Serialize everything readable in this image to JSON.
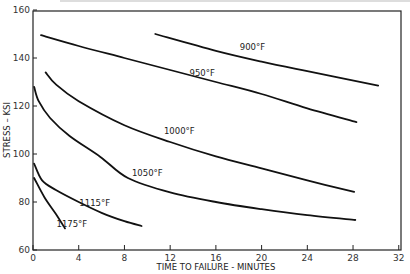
{
  "chart_data": {
    "type": "line",
    "title": "",
    "xlabel": "TIME TO FAILURE -  MINUTES",
    "ylabel": "STRESS – KSI",
    "xlim": [
      0,
      32
    ],
    "ylim": [
      60,
      160
    ],
    "xticks": [
      0,
      4,
      8,
      12,
      16,
      20,
      24,
      28,
      32
    ],
    "yticks": [
      60,
      80,
      100,
      120,
      140,
      160
    ],
    "grid": false,
    "legend": "inline labels",
    "series": [
      {
        "name": "900°F",
        "x": [
          10.7,
          16,
          20,
          24,
          30.2
        ],
        "y": [
          150,
          143,
          138.5,
          134.5,
          128.5
        ]
      },
      {
        "name": "950°F",
        "x": [
          0.7,
          4,
          8,
          12,
          16,
          20,
          24,
          28.3
        ],
        "y": [
          149.5,
          145,
          140,
          135,
          130,
          125,
          119,
          113.3
        ]
      },
      {
        "name": "1000°F",
        "x": [
          1.1,
          2,
          4,
          8,
          12,
          16,
          20,
          24,
          28.1
        ],
        "y": [
          134,
          129,
          122,
          112,
          105,
          99,
          94,
          89,
          84.2
        ]
      },
      {
        "name": "1050°F",
        "x": [
          0.1,
          0.5,
          1.5,
          3.2,
          5.9,
          8.3,
          12,
          16,
          20,
          24,
          28.2
        ],
        "y": [
          128,
          122,
          115,
          107.5,
          98.8,
          90,
          84,
          80,
          77,
          74.5,
          72.5
        ]
      },
      {
        "name": "1115°F",
        "x": [
          0.1,
          0.8,
          2,
          4,
          6,
          8,
          9.5
        ],
        "y": [
          96,
          89,
          85,
          80,
          75.5,
          72,
          70
        ]
      },
      {
        "name": "1175°F",
        "x": [
          0.1,
          1,
          2,
          2.8
        ],
        "y": [
          90,
          82,
          75,
          69
        ]
      }
    ],
    "annotations": [
      {
        "text": "900°F",
        "x": 19.2,
        "y": 143.5
      },
      {
        "text": "950°F",
        "x": 14.8,
        "y": 132.5
      },
      {
        "text": "1000°F",
        "x": 12.8,
        "y": 108.5
      },
      {
        "text": "1050°F",
        "x": 10,
        "y": 91
      },
      {
        "text": "1115°F",
        "x": 5.4,
        "y": 78.5
      },
      {
        "text": "1175°F",
        "x": 3.4,
        "y": 69.5
      }
    ]
  },
  "labels": {
    "x_axis_title": "TIME TO FAILURE -  MINUTES",
    "y_axis_title": "STRESS – KSI",
    "x_ticks": [
      "0",
      "4",
      "8",
      "12",
      "16",
      "20",
      "24",
      "28",
      "32"
    ],
    "y_ticks": [
      "60",
      "80",
      "100",
      "120",
      "140",
      "160"
    ],
    "series": [
      "900°F",
      "950°F",
      "1000°F",
      "1050°F",
      "1115°F",
      "1175°F"
    ]
  },
  "colors": {
    "line": "#111111",
    "frame": "#222222",
    "text": "#222222"
  }
}
